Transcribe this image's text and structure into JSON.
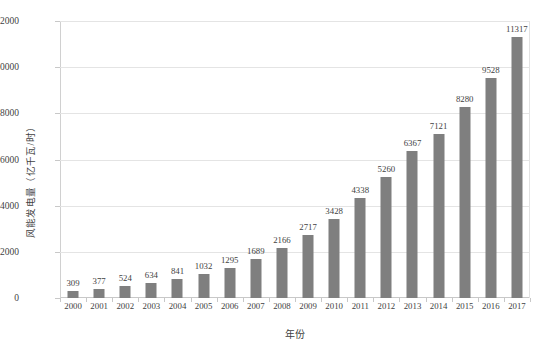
{
  "chart_data": {
    "type": "bar",
    "title": "",
    "xlabel": "年份",
    "ylabel": "风能发电量（亿千瓦/时）",
    "categories": [
      "2000",
      "2001",
      "2002",
      "2003",
      "2004",
      "2005",
      "2006",
      "2007",
      "2008",
      "2009",
      "2010",
      "2011",
      "2012",
      "2013",
      "2014",
      "2015",
      "2016",
      "2017"
    ],
    "values": [
      309,
      377,
      524,
      634,
      841,
      1032,
      1295,
      1689,
      2166,
      2717,
      3428,
      4338,
      5260,
      6367,
      7121,
      8280,
      9528,
      11317
    ],
    "ylim": [
      0,
      12000
    ],
    "yticks": [
      "0",
      "2000",
      "4000",
      "6000",
      "8000",
      "10000",
      "12000"
    ],
    "ytick_values": [
      0,
      2000,
      4000,
      6000,
      8000,
      10000,
      12000
    ],
    "grid": true,
    "legend": "none",
    "bar_color": "#7f7f7f",
    "grid_color": "#e4e4e4",
    "axis_color": "#c8c8c8",
    "text_color": "#3f3f3f",
    "background": "#ffffff",
    "data_labels": true
  }
}
